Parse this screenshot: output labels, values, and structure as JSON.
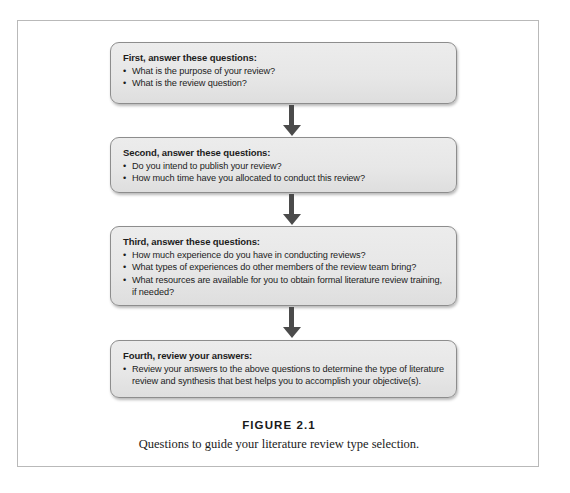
{
  "figure": {
    "label": "FIGURE 2.1",
    "caption": "Questions to guide your literature review type selection.",
    "colors": {
      "box_fill": "#e8e8e8",
      "box_border": "#8d8d8d",
      "arrow": "#4b4b4b",
      "frame_border": "#b9b9b9",
      "text": "#1c1c1c"
    }
  },
  "flow": {
    "steps": [
      {
        "heading": "First, answer these questions:",
        "bullets": [
          "What is the purpose of your review?",
          "What is the review question?"
        ]
      },
      {
        "heading": "Second, answer these questions:",
        "bullets": [
          "Do you intend to publish your review?",
          "How much time have you allocated to conduct this review?"
        ]
      },
      {
        "heading": "Third, answer these questions:",
        "bullets": [
          "How much experience do you have in conducting reviews?",
          "What types of experiences do other members of the review team bring?",
          "What resources are available for you to obtain formal literature review training, if needed?"
        ]
      },
      {
        "heading": "Fourth, review your answers:",
        "bullets": [
          "Review your answers to the above questions to determine the type of literature review and synthesis that best helps you to accomplish your objective(s)."
        ]
      }
    ],
    "connectors": [
      {
        "name": "arrow-step1-to-step2"
      },
      {
        "name": "arrow-step2-to-step3"
      },
      {
        "name": "arrow-step3-to-step4"
      }
    ]
  }
}
